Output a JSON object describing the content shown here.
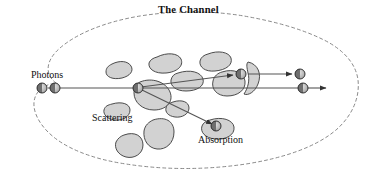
{
  "figure": {
    "title": "The Channel",
    "domain_type": "diagram",
    "description_labels": {
      "photons": "Photons",
      "scattering": "Scattering",
      "absorption": "Absorption"
    },
    "colors": {
      "background": "#ffffff",
      "boundary_stroke": "#8a8a8a",
      "particle_fill": "#d2d2d2",
      "particle_stroke": "#3a3a3a",
      "ray_stroke": "#555555",
      "photon_dark": "#6f6f6f",
      "photon_light": "#cfcfcf",
      "photon_stroke": "#222222",
      "text": "#111111"
    },
    "boundary": {
      "name": "channel-boundary",
      "style": "dashed",
      "dash_pattern": "3 3",
      "stroke_width": 1,
      "path": "M 56,83 C 44,74 46,60 60,48 C 76,34 104,22 140,16 C 178,10 214,11 244,16 C 272,21 300,28 324,40 C 344,50 356,64 358,80 C 360,98 352,116 336,130 C 316,147 284,158 246,164 C 206,170 164,170 126,164 C 92,159 64,148 48,132 C 34,118 30,102 38,92 C 43,86 49,84 56,83 Z"
    },
    "rays": [
      {
        "name": "incoming-beam",
        "x1": 48,
        "y1": 88,
        "x2": 137,
        "y2": 88,
        "arrow": false
      },
      {
        "name": "straight-through-beam",
        "x1": 137,
        "y1": 88,
        "x2": 300,
        "y2": 88,
        "arrow": false
      },
      {
        "name": "exit-ray-lower",
        "x1": 306,
        "y1": 88,
        "x2": 326,
        "y2": 88,
        "arrow": true
      },
      {
        "name": "scattered-ray-upper",
        "x1": 141,
        "y1": 87,
        "x2": 233,
        "y2": 75,
        "arrow": true
      },
      {
        "name": "rescattered-ray-upper",
        "x1": 248,
        "y1": 74,
        "x2": 292,
        "y2": 74,
        "arrow": true
      },
      {
        "name": "absorbed-ray",
        "x1": 142,
        "y1": 90,
        "x2": 212,
        "y2": 124,
        "arrow": true
      }
    ],
    "photons": [
      {
        "name": "photon-incident-1",
        "cx": 42,
        "cy": 88,
        "r": 5
      },
      {
        "name": "photon-incident-2",
        "cx": 55,
        "cy": 88,
        "r": 5
      },
      {
        "name": "photon-at-scatter-site",
        "cx": 138,
        "cy": 88,
        "r": 5
      },
      {
        "name": "photon-scattered-upper",
        "cx": 241,
        "cy": 74,
        "r": 5
      },
      {
        "name": "photon-exit-upper",
        "cx": 300,
        "cy": 74,
        "r": 5
      },
      {
        "name": "photon-exit-lower",
        "cx": 303,
        "cy": 88,
        "r": 5
      },
      {
        "name": "photon-absorbed",
        "cx": 216,
        "cy": 126,
        "r": 5
      }
    ],
    "particles": [
      {
        "name": "particle-1",
        "path": "M 112,64 C 120,60 128,61 131,66 C 134,71 130,76 122,78 C 113,80 106,77 106,72 C 106,68 108,66 112,64 Z"
      },
      {
        "name": "particle-2",
        "path": "M 157,57 C 167,52 178,53 181,59 C 184,66 177,72 166,73 C 155,74 148,69 149,63 C 150,60 153,58 157,57 Z"
      },
      {
        "name": "particle-3",
        "path": "M 208,54 C 218,50 229,52 231,58 C 233,65 226,70 215,71 C 205,72 199,67 200,61 C 201,57 204,55 208,54 Z"
      },
      {
        "name": "particle-4",
        "path": "M 178,73 C 190,69 201,72 203,79 C 205,86 197,91 186,91 C 176,91 170,86 171,80 C 172,76 174,74 178,73 Z"
      },
      {
        "name": "particle-5-scatter-center",
        "path": "M 140,82 C 152,77 166,82 170,92 C 174,102 166,110 154,110 C 142,110 134,102 134,93 C 134,87 136,84 140,82 Z"
      },
      {
        "name": "particle-6",
        "path": "M 222,72 C 234,68 244,73 245,81 C 246,90 238,96 227,96 C 217,96 211,89 213,81 C 214,76 218,73 222,72 Z"
      },
      {
        "name": "particle-7-crescent",
        "path": "M 248,62 C 258,64 262,74 258,84 C 255,92 248,96 244,94 C 248,88 250,80 248,73 C 247,68 246,64 248,62 Z"
      },
      {
        "name": "particle-8",
        "path": "M 112,104 C 122,101 130,104 130,110 C 130,117 122,121 114,120 C 107,119 103,114 104,110 C 105,106 108,105 112,104 Z"
      },
      {
        "name": "particle-9",
        "path": "M 173,102 C 182,99 189,102 189,108 C 189,114 182,118 175,117 C 168,116 165,112 166,108 C 167,104 170,103 173,102 Z"
      },
      {
        "name": "particle-10",
        "path": "M 153,120 C 165,116 174,121 174,132 C 174,143 166,150 157,149 C 148,148 143,140 144,131 C 145,125 149,122 153,120 Z"
      },
      {
        "name": "particle-11",
        "path": "M 124,135 C 135,131 143,136 143,145 C 143,154 134,159 126,157 C 118,155 114,148 116,142 C 118,138 121,136 124,135 Z"
      },
      {
        "name": "particle-12-absorber",
        "path": "M 210,120 C 222,116 233,120 234,127 C 235,135 226,140 215,139 C 205,138 200,132 202,126 C 203,123 206,121 210,120 Z"
      }
    ]
  }
}
